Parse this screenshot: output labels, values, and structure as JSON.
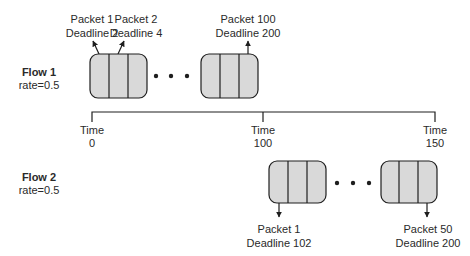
{
  "colors": {
    "box_fill": "#d9d9d9",
    "stroke": "#1e1e1e",
    "text": "#2a2a2a",
    "background": "#ffffff"
  },
  "flows": [
    {
      "name": "Flow 1",
      "rate": "rate=0.5",
      "first_packets": [
        {
          "packet": "Packet 1",
          "deadline": "Deadline 2"
        },
        {
          "packet": "Packet 2",
          "deadline": "Deadline 4"
        }
      ],
      "last_packet": {
        "packet": "Packet 100",
        "deadline": "Deadline 200"
      }
    },
    {
      "name": "Flow 2",
      "rate": "rate=0.5",
      "first_packet": {
        "packet": "Packet 1",
        "deadline": "Deadline 102"
      },
      "last_packet": {
        "packet": "Packet 50",
        "deadline": "Deadline 200"
      }
    }
  ],
  "timeline": {
    "label": "Time",
    "ticks": [
      "0",
      "100",
      "150"
    ]
  }
}
